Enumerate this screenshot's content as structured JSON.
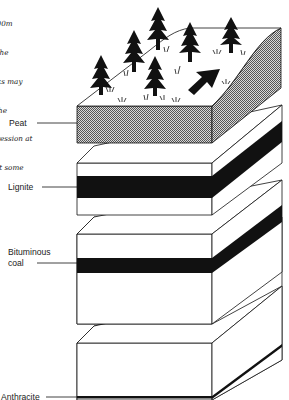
{
  "caption": {
    "lines": [
      "…6,000m",
      "…nd the",
      "…rocks may",
      "…ar the",
      "…mpression at",
      "…ry at some",
      "…n."
    ]
  },
  "labels": {
    "peat": "Peat",
    "lignite": "Lignite",
    "bituminous_line1": "Bituminous",
    "bituminous_line2": "coal",
    "anthracite": "Anthracite"
  },
  "colors": {
    "ink": "#111111",
    "peat_fill": "#b5b5b5",
    "paper": "#ffffff"
  }
}
